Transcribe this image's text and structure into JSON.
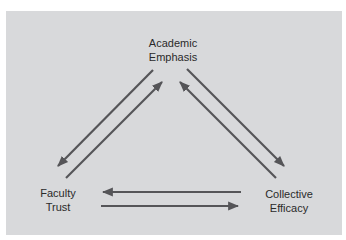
{
  "diagram": {
    "type": "cycle-triangle",
    "background_color": "#d8d9db",
    "arrow_color": "#555558",
    "nodes": [
      {
        "id": "academic_emphasis",
        "lines": [
          "Academic",
          "Emphasis"
        ]
      },
      {
        "id": "faculty_trust",
        "lines": [
          "Faculty",
          "Trust"
        ]
      },
      {
        "id": "collective_efficacy",
        "lines": [
          "Collective",
          "Efficacy"
        ]
      }
    ],
    "edges": [
      {
        "from": "academic_emphasis",
        "to": "faculty_trust"
      },
      {
        "from": "faculty_trust",
        "to": "academic_emphasis"
      },
      {
        "from": "academic_emphasis",
        "to": "collective_efficacy"
      },
      {
        "from": "collective_efficacy",
        "to": "academic_emphasis"
      },
      {
        "from": "collective_efficacy",
        "to": "faculty_trust"
      },
      {
        "from": "faculty_trust",
        "to": "collective_efficacy"
      }
    ]
  }
}
